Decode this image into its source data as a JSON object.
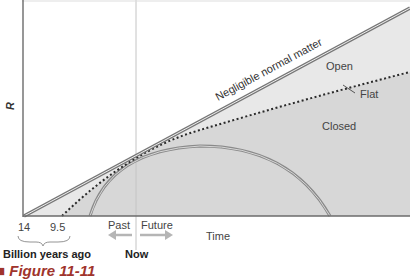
{
  "figure": {
    "y_axis_label": "R",
    "x_axis_label": "Time",
    "tick_labels": [
      "14",
      "9.5"
    ],
    "tick_caption": "Billion years ago",
    "now_label": "Now",
    "past_label": "Past",
    "future_label": "Future",
    "curves": {
      "empty": "Negligible normal matter",
      "open": "Open",
      "flat": "Flat",
      "closed": "Closed"
    },
    "caption": "Figure 11-11",
    "colors": {
      "axis": "#6b6b6b",
      "empty_line": "#7a7a7a",
      "open_fill": "#e6e6e6",
      "closed_fill": "#d6d6d6",
      "dotted": "#2a2a2a",
      "arrow": "#b5b5b5",
      "now_line": "#bdbdbd",
      "caption": "#a0342c"
    }
  }
}
